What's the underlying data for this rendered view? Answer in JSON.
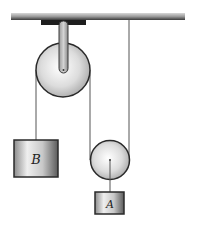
{
  "diagram": {
    "type": "pulley-system",
    "labels": {
      "block_b": "B",
      "block_a": "A"
    },
    "colors": {
      "ceiling": "#6e6e6e",
      "rope": "#555555",
      "outline": "#2a2a2a",
      "metal_light": "#f2f2f2",
      "metal_dark": "#8a8a8a"
    }
  }
}
